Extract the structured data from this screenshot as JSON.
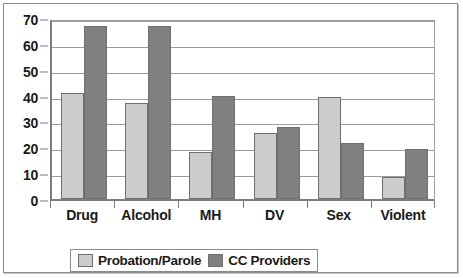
{
  "chart_data": {
    "type": "bar",
    "title": "",
    "subtitle": "",
    "xlabel": "",
    "ylabel": "",
    "categories": [
      "Drug",
      "Alcohol",
      "MH",
      "DV",
      "Sex",
      "Violent"
    ],
    "series": [
      {
        "name": "Probation/Parole",
        "color": "#cccccc",
        "values": [
          41,
          37,
          18,
          25.5,
          39.5,
          8.5
        ]
      },
      {
        "name": "CC Providers",
        "color": "#808080",
        "values": [
          67,
          67,
          40,
          28,
          21.5,
          19.5
        ]
      }
    ],
    "ylim": [
      0,
      70
    ],
    "ytick_step": 10,
    "yticks": [
      "0",
      "10",
      "20",
      "30",
      "40",
      "50",
      "60",
      "70"
    ],
    "grid": true,
    "grid_axis": "y",
    "legend_position": "bottom"
  },
  "legend": {
    "items": [
      {
        "label": "Probation/Parole",
        "swatch": "legend-swatch-probation-parole"
      },
      {
        "label": "CC Providers",
        "swatch": "legend-swatch-cc-providers"
      }
    ]
  },
  "colors": {
    "series_light": "#cccccc",
    "series_dark": "#808080",
    "axis": "#7d7d7d",
    "grid": "#9d9d9d",
    "frame": "#8b8b8b",
    "text": "#1a1a1a",
    "background": "#ffffff"
  }
}
